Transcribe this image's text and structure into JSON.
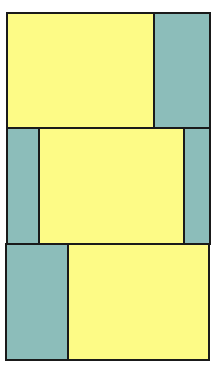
{
  "colors": {
    "yellow": "#FDFB86",
    "teal": "#8CBDBA",
    "border": "#1a1a1a"
  },
  "diagram": {
    "title": "",
    "panels": [
      {
        "id": "panel-1",
        "box": {
          "x": 6,
          "y": 12,
          "w": 205,
          "h": 117
        },
        "cells": [
          {
            "color": "yellow",
            "width": 145
          },
          {
            "color": "teal",
            "width": 56
          }
        ]
      },
      {
        "id": "panel-2",
        "box": {
          "x": 6,
          "y": 127,
          "w": 205,
          "h": 118
        },
        "cells": [
          {
            "color": "teal",
            "width": 30
          },
          {
            "color": "yellow",
            "width": 145
          },
          {
            "color": "teal",
            "width": 26
          }
        ]
      },
      {
        "id": "panel-3",
        "box": {
          "x": 5,
          "y": 243,
          "w": 205,
          "h": 118
        },
        "cells": [
          {
            "color": "teal",
            "width": 60
          },
          {
            "color": "yellow",
            "width": 141
          }
        ]
      }
    ]
  }
}
